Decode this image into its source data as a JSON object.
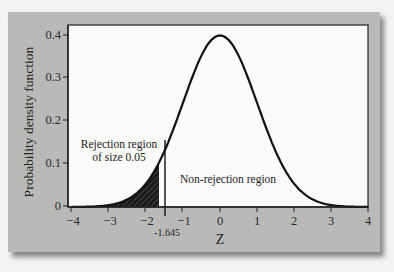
{
  "chart_data": {
    "type": "line",
    "title": "",
    "xlabel": "Z",
    "ylabel": "Probability density function",
    "xlim": [
      -4,
      4
    ],
    "ylim": [
      0,
      0.42
    ],
    "x_ticks": [
      "-4",
      "-3",
      "-2",
      "-1",
      "0",
      "1",
      "2",
      "3",
      "4"
    ],
    "y_ticks": [
      "0",
      "0.1",
      "0.2",
      "0.3",
      "0.4"
    ],
    "grid": false,
    "series": [
      {
        "name": "Standard normal density",
        "x": [
          -4,
          -3,
          -2,
          -1.645,
          -1,
          0,
          1,
          2,
          3,
          4
        ],
        "y": [
          0.0001,
          0.0044,
          0.054,
          0.103,
          0.242,
          0.399,
          0.242,
          0.054,
          0.0044,
          0.0001
        ]
      }
    ],
    "critical_value": -1.645,
    "critical_value_label": "-1.645",
    "shaded_region": {
      "from": -4,
      "to": -1.645,
      "pattern": "hatched",
      "area": 0.05
    },
    "annotations": [
      {
        "text": "Rejection region",
        "x": -3.4,
        "y": 0.135
      },
      {
        "text": "of size 0.05",
        "x": -3.4,
        "y": 0.115
      },
      {
        "text": "Non-rejection region",
        "x": 0.4,
        "y": 0.065
      }
    ]
  },
  "labels": {
    "ylabel": "Probability density function",
    "xlabel": "Z",
    "critical": "-1.645",
    "rejection_line1": "Rejection region",
    "rejection_line2": "of size 0.05",
    "non_rejection": "Non-rejection region",
    "xticks": [
      "−4",
      "−3",
      "−2",
      "−1",
      "0",
      "1",
      "2",
      "3",
      "4"
    ],
    "yticks": [
      "0",
      "0.1",
      "0.2",
      "0.3",
      "0.4"
    ]
  },
  "colors": {
    "panel": "#b9b9b7",
    "plot_bg": "#fafaf8",
    "curve": "#111111",
    "shade": "#1a1a1a"
  }
}
